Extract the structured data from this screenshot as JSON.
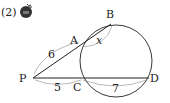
{
  "problem_number": "(2)",
  "badge_icon": "difficulty-badge-icon",
  "points": {
    "P": "P",
    "A": "A",
    "B": "B",
    "C": "C",
    "D": "D"
  },
  "lengths": {
    "PA": "6",
    "PC": "5",
    "CD": "7",
    "AB": "x"
  }
}
